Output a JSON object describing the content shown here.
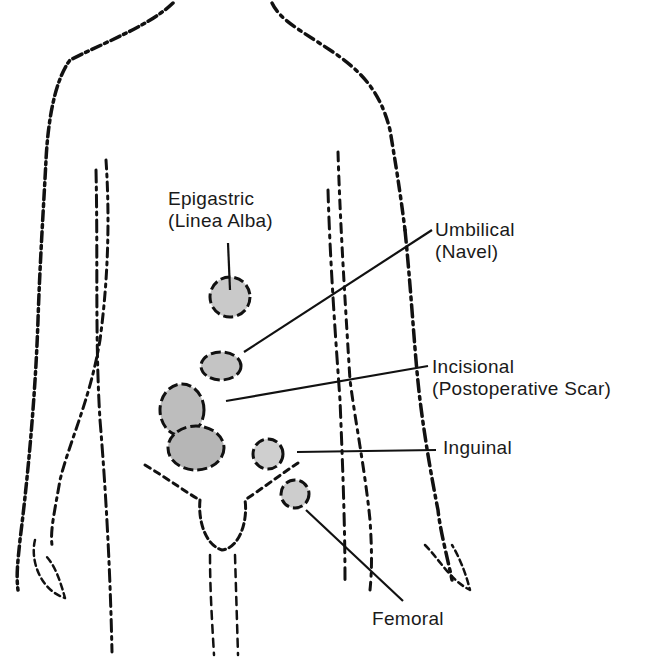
{
  "diagram": {
    "colors": {
      "outline": "#111111",
      "hernia_fill": "#bdbdbd",
      "background": "#ffffff"
    },
    "labels": [
      {
        "id": "epigastric",
        "line1": "Epigastric",
        "line2": "(Linea Alba)",
        "x": 168,
        "y": 188
      },
      {
        "id": "umbilical",
        "line1": "Umbilical",
        "line2": "(Navel)",
        "x": 435,
        "y": 219
      },
      {
        "id": "incisional",
        "line1": "Incisional",
        "line2": "(Postoperative Scar)",
        "x": 432,
        "y": 356
      },
      {
        "id": "inguinal",
        "line1": "Inguinal",
        "line2": "",
        "x": 443,
        "y": 437
      },
      {
        "id": "femoral",
        "line1": "Femoral",
        "line2": "",
        "x": 372,
        "y": 608
      }
    ]
  }
}
